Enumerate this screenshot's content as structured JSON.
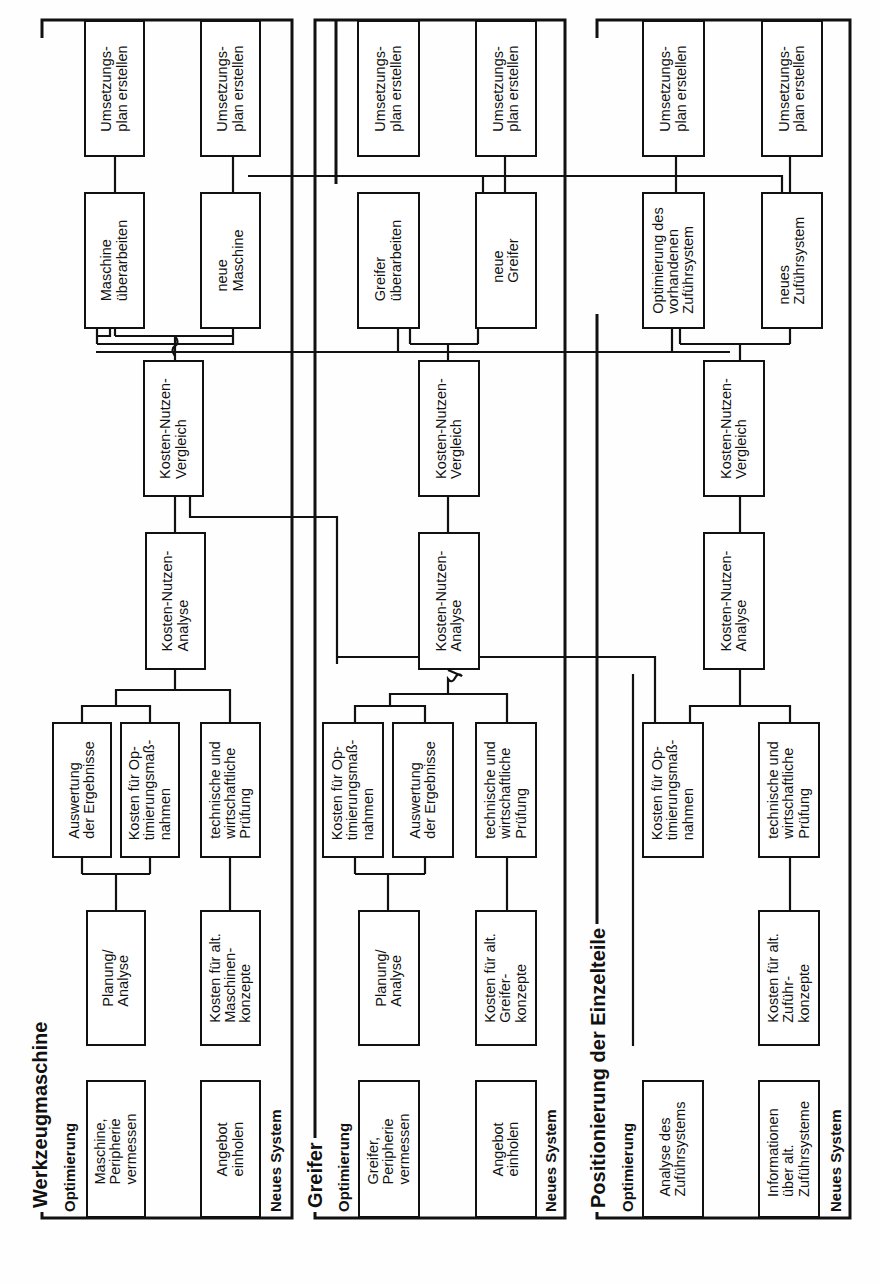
{
  "panels": [
    {
      "title": "Werkzeugmaschine",
      "lanes": {
        "top": "Optimierung",
        "bottom": "Neues System"
      },
      "boxes": {
        "measure": "Maschine,\nPeripherie\nvermessen",
        "planning": "Planung/\nAnalyse",
        "evaluation": "Auswertung\nder Ergebnisse",
        "opt_costs": "Kosten für Op-\ntimierungsmaß-\nnahmen",
        "offer": "Angebot\neinholen",
        "alt_costs": "Kosten für alt.\nMaschinen-\nkonzepte",
        "check": "technische und\nwirtschaftliche\nPrüfung",
        "kna": "Kosten-Nutzen-\nAnalyse",
        "knv": "Kosten-Nutzen-\nVergleich",
        "rework": "Maschine\nüberarbeiten",
        "new": "neue\nMaschine",
        "plan1": "Umsetzungs-\nplan erstellen",
        "plan2": "Umsetzungs-\nplan erstellen"
      }
    },
    {
      "title": "Greifer",
      "lanes": {
        "top": "Optimierung",
        "bottom": "Neues System"
      },
      "boxes": {
        "measure": "Greifer,\nPeripherie\nvermessen",
        "planning": "Planung/\nAnalyse",
        "opt_costs": "Kosten für Op-\ntimierungsmaß-\nnahmen",
        "evaluation": "Auswertung\nder Ergebnisse",
        "offer": "Angebot\neinholen",
        "alt_costs": "Kosten für alt.\nGreifer-\nkonzepte",
        "check": "technische und\nwirtschaftliche\nPrüfung",
        "kna": "Kosten-Nutzen-\nAnalyse",
        "knv": "Kosten-Nutzen-\nVergleich",
        "rework": "Greifer\nüberarbeiten",
        "new": "neue\nGreifer",
        "plan1": "Umsetzungs-\nplan erstellen",
        "plan2": "Umsetzungs-\nplan erstellen"
      }
    },
    {
      "title": "Positionierung der Einzelteile",
      "lanes": {
        "top": "Optimierung",
        "bottom": "Neues System"
      },
      "boxes": {
        "analysis": "Analyse des\nZuführsystems",
        "opt_costs": "Kosten für Op-\ntimierungsmaß-\nnahmen",
        "info": "Informationen\nüber alt.\nZuführsysteme",
        "alt_costs": "Kosten für alt.\nZuführ-\nkonzepte",
        "check": "technische und\nwirtschaftliche\nPrüfung",
        "kna": "Kosten-Nutzen-\nAnalyse",
        "knv": "Kosten-Nutzen-\nVergleich",
        "rework": "Optimierung des\nvorhandenen\nZuführsystem",
        "new": "neues\nZuführsystem",
        "plan1": "Umsetzungs-\nplan erstellen",
        "plan2": "Umsetzungs-\nplan erstellen"
      }
    }
  ]
}
